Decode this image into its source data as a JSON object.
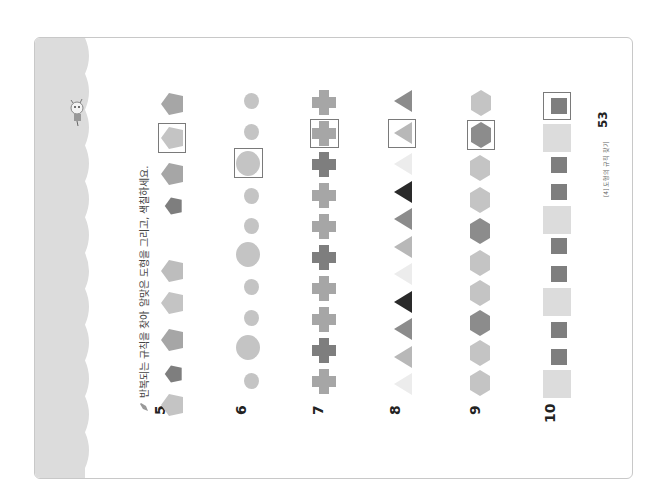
{
  "page": {
    "instruction": "반복되는 규칙을 찾아 알맞은 도형을 그리고, 색칠하세요.",
    "footer_section": "[4] 도형의 규칙 찾기",
    "page_number": "53"
  },
  "colors": {
    "band": "#dcdcdc",
    "light": "#c4c4c4",
    "mid": "#a6a6a6",
    "dark": "#7e7e7e",
    "black": "#2a2a2a",
    "pale": "#ececec",
    "answer_border": "#7a7a7a"
  },
  "problems": [
    {
      "number": "5",
      "shape": "pentagon",
      "sequence": [
        "light-large",
        "dark-small",
        "mid-large",
        "light-large",
        "light-large",
        "dark-small",
        "mid-large"
      ],
      "answer": "light-large",
      "after_answer": [
        "mid-large"
      ]
    },
    {
      "number": "6",
      "shape": "circle",
      "sequence": [
        "small",
        "large",
        "small",
        "small",
        "large",
        "small",
        "small"
      ],
      "answer": "large",
      "after_answer": [
        "small",
        "small"
      ]
    },
    {
      "number": "7",
      "shape": "cross",
      "sequence": [
        "mid",
        "dark",
        "mid",
        "mid",
        "dark",
        "mid",
        "mid",
        "dark"
      ],
      "answer": "mid",
      "after_answer": [
        "mid"
      ]
    },
    {
      "number": "8",
      "shape": "triangle",
      "sequence": [
        "pale",
        "light",
        "mid",
        "black",
        "pale",
        "light",
        "mid",
        "black",
        "pale"
      ],
      "answer": "light",
      "after_answer": [
        "mid"
      ]
    },
    {
      "number": "9",
      "shape": "hexagon",
      "sequence": [
        "light",
        "light",
        "dark",
        "light",
        "light",
        "dark",
        "light",
        "light"
      ],
      "answer": "dark",
      "after_answer": [
        "light"
      ]
    },
    {
      "number": "10",
      "shape": "square",
      "sequence": [
        "pale-large",
        "dark-small",
        "dark-small",
        "pale-large",
        "dark-small",
        "dark-small",
        "pale-large",
        "dark-small",
        "dark-small",
        "pale-large"
      ],
      "answer": "dark-small",
      "after_answer": []
    }
  ]
}
